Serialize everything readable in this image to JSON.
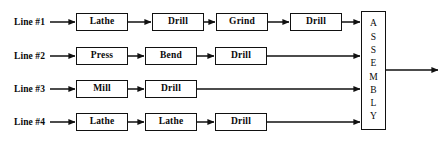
{
  "diagram": {
    "background_color": "#ffffff",
    "stroke_color": "#111111",
    "text_color": "#0a0a0a",
    "lines": [
      {
        "label": "Line #1",
        "label_x": 14,
        "y": 22,
        "steps": [
          {
            "label": "Lathe",
            "x": 76,
            "width": 52
          },
          {
            "label": "Drill",
            "x": 152,
            "width": 52
          },
          {
            "label": "Grind",
            "x": 216,
            "width": 52
          },
          {
            "label": "Drill",
            "x": 290,
            "width": 52
          }
        ]
      },
      {
        "label": "Line #2",
        "label_x": 14,
        "y": 56,
        "steps": [
          {
            "label": "Press",
            "x": 76,
            "width": 52
          },
          {
            "label": "Bend",
            "x": 145,
            "width": 52
          },
          {
            "label": "Drill",
            "x": 215,
            "width": 52
          }
        ]
      },
      {
        "label": "Line #3",
        "label_x": 14,
        "y": 89,
        "steps": [
          {
            "label": "Mill",
            "x": 76,
            "width": 52
          },
          {
            "label": "Drill",
            "x": 145,
            "width": 52
          }
        ]
      },
      {
        "label": "Line #4",
        "label_x": 14,
        "y": 122,
        "steps": [
          {
            "label": "Lathe",
            "x": 76,
            "width": 52
          },
          {
            "label": "Lathe",
            "x": 145,
            "width": 52
          },
          {
            "label": "Drill",
            "x": 215,
            "width": 52
          }
        ]
      }
    ],
    "box_height": 18,
    "assembly": {
      "label": "ASSEMBLY",
      "letters": [
        "A",
        "S",
        "S",
        "E",
        "M",
        "B",
        "L",
        "Y"
      ],
      "x": 361,
      "y": 11,
      "width": 25,
      "height": 119
    },
    "output": {
      "from_x": 386,
      "to_x": 440,
      "y": 70
    }
  }
}
